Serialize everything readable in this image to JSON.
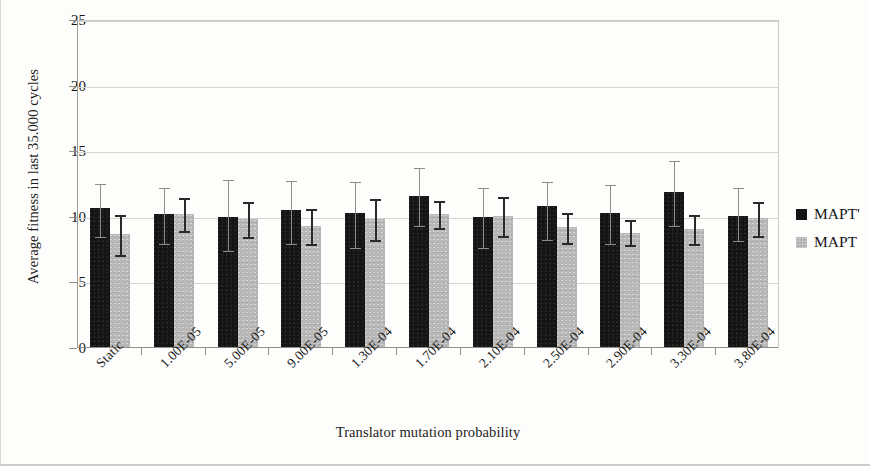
{
  "chart_data": {
    "type": "bar",
    "title": "",
    "xlabel": "Translator mutation probability",
    "ylabel": "Average fitness in last 35.000 cycles",
    "ylim": [
      0,
      25
    ],
    "yticks": [
      0,
      5,
      10,
      15,
      20,
      25
    ],
    "grid": true,
    "legend_position": "right",
    "error_bars": true,
    "categories": [
      "Static",
      "1.00E-05",
      "5.00E-05",
      "9.00E-05",
      "1.30E-04",
      "1.70E-04",
      "2.10E-04",
      "2.50E-04",
      "2.90E-04",
      "3.30E-04",
      "3.80E-04"
    ],
    "series": [
      {
        "name": "MAPT'",
        "color": "#141414",
        "values": [
          10.7,
          10.2,
          10.0,
          10.5,
          10.3,
          11.6,
          10.0,
          10.8,
          10.3,
          11.9,
          10.1
        ],
        "err_low": [
          8.5,
          8.0,
          7.5,
          8.0,
          7.7,
          9.4,
          7.7,
          8.3,
          8.0,
          9.4,
          8.2
        ],
        "err_high": [
          12.6,
          12.3,
          12.9,
          12.8,
          12.7,
          13.8,
          12.3,
          12.7,
          12.5,
          14.3,
          12.3
        ]
      },
      {
        "name": "MAPT",
        "color": "#b8b8b8",
        "values": [
          8.7,
          10.2,
          9.8,
          9.3,
          9.8,
          10.2,
          10.1,
          9.2,
          8.8,
          9.1,
          9.9
        ],
        "err_low": [
          7.2,
          9.0,
          8.5,
          8.0,
          8.3,
          9.2,
          8.6,
          8.1,
          7.9,
          8.0,
          8.6
        ],
        "err_high": [
          10.2,
          11.5,
          11.2,
          10.7,
          11.4,
          11.3,
          11.6,
          10.4,
          9.8,
          10.2,
          11.2
        ]
      }
    ]
  },
  "legend": {
    "items": [
      {
        "label": "MAPT'",
        "swatch": "series-0-swatch"
      },
      {
        "label": "MAPT",
        "swatch": "series-1-swatch"
      }
    ]
  }
}
